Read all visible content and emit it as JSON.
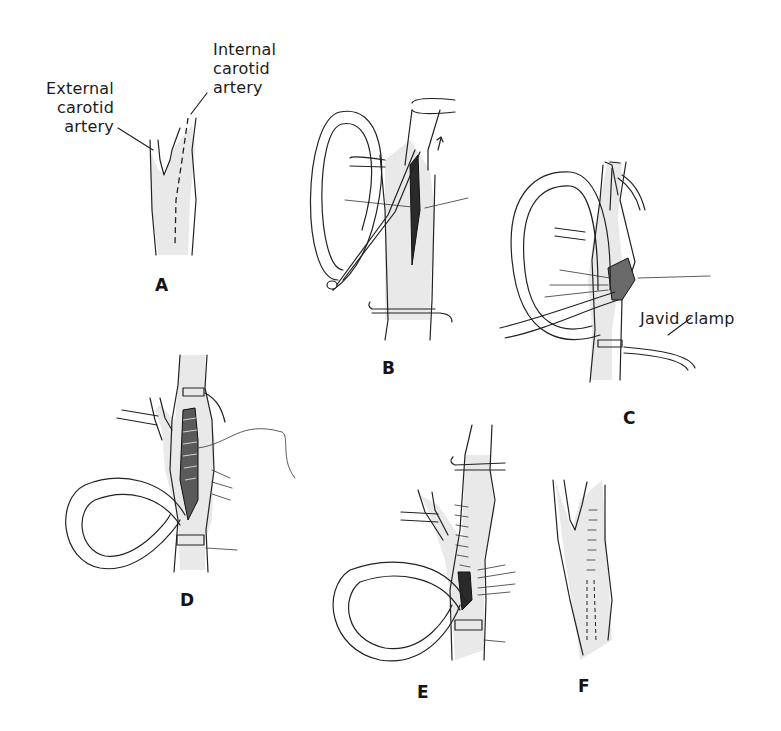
{
  "figure": {
    "panels": [
      {
        "id": "A",
        "letter": "A",
        "callouts": [
          "External carotid artery",
          "Internal carotid artery"
        ]
      },
      {
        "id": "B",
        "letter": "B"
      },
      {
        "id": "C",
        "letter": "C",
        "callouts": [
          "Javid clamp"
        ]
      },
      {
        "id": "D",
        "letter": "D"
      },
      {
        "id": "E",
        "letter": "E"
      },
      {
        "id": "F",
        "letter": "F"
      }
    ],
    "labels": {
      "external_line1": "External",
      "external_line2": "carotid",
      "external_line3": "artery",
      "internal_line1": "Internal",
      "internal_line2": "carotid",
      "internal_line3": "artery",
      "javid_clamp": "Javid clamp"
    },
    "colors": {
      "ink": "#222222",
      "stipple": "#e9e9e9",
      "background": "#ffffff"
    }
  }
}
